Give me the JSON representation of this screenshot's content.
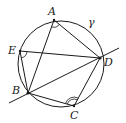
{
  "figure": {
    "type": "geometry",
    "stroke_color": "#1a1a1a",
    "background": "#ffffff",
    "circle": {
      "label": "γ",
      "cx": 61,
      "cy": 64,
      "r": 43,
      "label_x": 88,
      "label_y": 26
    },
    "points": [
      {
        "name": "A",
        "x": 54,
        "y": 20,
        "label_x": 48,
        "label_y": 15
      },
      {
        "name": "B",
        "x": 28,
        "y": 93,
        "label_x": 12,
        "label_y": 94
      },
      {
        "name": "C",
        "x": 74,
        "y": 106,
        "label_x": 70,
        "label_y": 119
      },
      {
        "name": "D",
        "x": 100,
        "y": 58,
        "label_x": 104,
        "label_y": 66
      },
      {
        "name": "E",
        "x": 20,
        "y": 51,
        "label_x": 8,
        "label_y": 54
      }
    ],
    "segments": [
      [
        "A",
        "D"
      ],
      [
        "A",
        "B"
      ],
      [
        "E",
        "D"
      ],
      [
        "E",
        "B"
      ],
      [
        "B",
        "C"
      ],
      [
        "C",
        "D"
      ]
    ],
    "secant_line": {
      "through": [
        "B",
        "D"
      ],
      "x1": 9,
      "y1": 103,
      "x2": 119,
      "y2": 48
    },
    "angle_marks": [
      {
        "vertex": "A",
        "arcs": 1
      },
      {
        "vertex": "E",
        "arcs": 1
      },
      {
        "vertex": "C",
        "arcs": 2
      }
    ]
  },
  "labels": {
    "A": "A",
    "B": "B",
    "C": "C",
    "D": "D",
    "E": "E",
    "gamma": "γ"
  }
}
